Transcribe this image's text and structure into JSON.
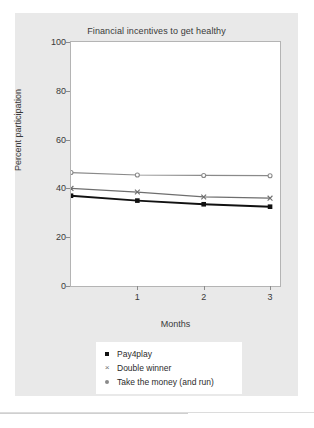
{
  "chart_data": {
    "type": "line",
    "title": "Financial incentives to get healthy",
    "xlabel": "Months",
    "ylabel": "Percent participation",
    "x": [
      0,
      1,
      2,
      3
    ],
    "xticks": [
      1,
      2,
      3
    ],
    "xticklabels": [
      "1",
      "2",
      "3"
    ],
    "yticks": [
      0,
      20,
      40,
      60,
      80,
      100
    ],
    "yticklabels": [
      "0",
      "20",
      "40",
      "60",
      "80",
      "100"
    ],
    "xlim": [
      0,
      3.15
    ],
    "ylim": [
      0,
      100
    ],
    "grid": false,
    "legend_position": "below-axes-center",
    "series": [
      {
        "name": "Pay4play",
        "marker": "square",
        "color": "#111111",
        "values": [
          37,
          35,
          33.5,
          32.5
        ]
      },
      {
        "name": "Double winner",
        "marker": "x",
        "color": "#6e6e6e",
        "values": [
          40,
          38.5,
          36.5,
          36
        ]
      },
      {
        "name": "Take the money (and run)",
        "marker": "circle",
        "color": "#8a8a8a",
        "values": [
          46.5,
          45.5,
          45.3,
          45.2
        ]
      }
    ]
  },
  "legend": {
    "items": [
      {
        "label": "Pay4play",
        "marker": "square-marker"
      },
      {
        "label": "Double winner",
        "marker": "x-marker"
      },
      {
        "label": "Take the money (and run)",
        "marker": "circle-marker"
      }
    ]
  },
  "colors": {
    "figure_background": "#e9e9e9",
    "plot_background": "#ffffff",
    "axis": "#b4b4b4",
    "text": "#3a3a3a"
  }
}
